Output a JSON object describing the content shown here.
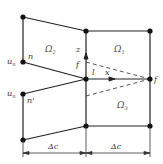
{
  "diagram": {
    "type": "finite-volume stencil",
    "colors": {
      "line": "#222222",
      "dashed": "#444444",
      "node": "#111111",
      "text": "#333333"
    },
    "regions": [
      {
        "id": "omega2",
        "label": "Ω",
        "sub": "2"
      },
      {
        "id": "omega1",
        "label": "Ω",
        "sub": "1"
      },
      {
        "id": "omega3",
        "label": "Ω",
        "sub": "3"
      }
    ],
    "labels": {
      "n": "n",
      "n_prime": "n'",
      "u_n": "u",
      "u_n_sub": "n",
      "u_n2": "u",
      "u_n2_sub": "n",
      "z": "z",
      "f_upper": "f",
      "l": "l",
      "x": "x",
      "f": "f"
    },
    "dimensions": [
      {
        "id": "left",
        "label": "Δc"
      },
      {
        "id": "right",
        "label": "Δc"
      }
    ]
  }
}
